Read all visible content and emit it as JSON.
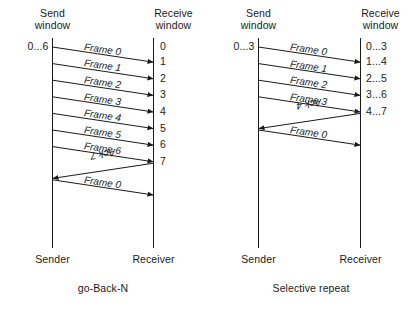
{
  "figure": {
    "background_color": "#ffffff",
    "line_color": "#1a1a1a",
    "text_color": "#1a1a1a"
  },
  "panels": [
    {
      "id": "go-back-n",
      "caption": "go-Back-N",
      "sender": {
        "header_line1": "Send",
        "header_line2": "window",
        "window_range": "0...6",
        "endpoint_label": "Sender"
      },
      "receiver": {
        "header_line1": "Receive",
        "header_line2": "window",
        "endpoint_label": "Receiver",
        "window_states": [
          "0",
          "1",
          "2",
          "3",
          "4",
          "5",
          "6",
          "7"
        ]
      },
      "messages": [
        {
          "label": "Frame 0",
          "direction": "to-receiver"
        },
        {
          "label": "Frame 1",
          "direction": "to-receiver"
        },
        {
          "label": "Frame 2",
          "direction": "to-receiver"
        },
        {
          "label": "Frame 3",
          "direction": "to-receiver"
        },
        {
          "label": "Frame 4",
          "direction": "to-receiver"
        },
        {
          "label": "Frame 5",
          "direction": "to-receiver"
        },
        {
          "label": "Frame 6",
          "direction": "to-receiver"
        },
        {
          "label": "Ack 7",
          "direction": "to-sender"
        },
        {
          "label": "Frame 0",
          "direction": "to-receiver"
        }
      ]
    },
    {
      "id": "selective-repeat",
      "caption": "Selective repeat",
      "sender": {
        "header_line1": "Send",
        "header_line2": "window",
        "window_range": "0...3",
        "endpoint_label": "Sender"
      },
      "receiver": {
        "header_line1": "Receive",
        "header_line2": "window",
        "endpoint_label": "Receiver",
        "window_states": [
          "0...3",
          "1...4",
          "2...5",
          "3...6",
          "4...7"
        ]
      },
      "messages": [
        {
          "label": "Frame 0",
          "direction": "to-receiver"
        },
        {
          "label": "Frame 1",
          "direction": "to-receiver"
        },
        {
          "label": "Frame 2",
          "direction": "to-receiver"
        },
        {
          "label": "Frame 3",
          "direction": "to-receiver"
        },
        {
          "label": "Ack 4",
          "direction": "to-sender"
        },
        {
          "label": "Frame 0",
          "direction": "to-receiver"
        }
      ]
    }
  ]
}
